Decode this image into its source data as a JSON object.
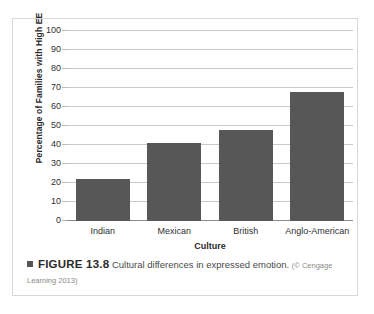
{
  "figure": {
    "marker": "square-bullet",
    "label": "FIGURE 13.8",
    "text": "Cultural differences in expressed emotion.",
    "credit": "(© Cengage Learning 2013)"
  },
  "colors": {
    "bar_fill": "#575757",
    "gridline": "#c9c9c9",
    "axis": "#8a8a8a",
    "panel_border": "#d8d8d8",
    "text": "#2f2f2f"
  },
  "chart_data": {
    "type": "bar",
    "title": "",
    "xlabel": "Culture",
    "ylabel": "Percentage of Families with High EE",
    "categories": [
      "Indian",
      "Mexican",
      "British",
      "Anglo-American"
    ],
    "values": [
      22,
      41,
      48,
      68
    ],
    "ylim": [
      0,
      100
    ],
    "yticks": [
      0,
      10,
      20,
      30,
      40,
      50,
      60,
      70,
      80,
      90,
      100
    ],
    "ytick_labels": [
      "0",
      "10",
      "20",
      "30",
      "40",
      "50",
      "60",
      "70",
      "80",
      "90",
      "100"
    ],
    "grid": true,
    "legend": false,
    "series": [
      {
        "name": "Percentage of Families with High EE",
        "values": [
          22,
          41,
          48,
          68
        ]
      }
    ]
  }
}
